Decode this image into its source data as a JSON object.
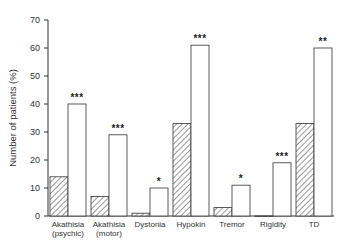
{
  "chart_data": {
    "type": "bar",
    "title": "",
    "xlabel": "",
    "ylabel": "Number of patients (%)",
    "ylim": [
      0,
      70
    ],
    "yticks": [
      0,
      10,
      20,
      30,
      40,
      50,
      60,
      70
    ],
    "grid": false,
    "legend": null,
    "categories": [
      [
        "Akathisia",
        "(psychic)"
      ],
      [
        "Akathisia",
        "(motor)"
      ],
      [
        "Dystonia"
      ],
      [
        "Hypokin"
      ],
      [
        "Tremor"
      ],
      [
        "Rigidity"
      ],
      [
        "TD"
      ]
    ],
    "series": [
      {
        "name": "hatched",
        "pattern": "diagonal-hatch",
        "values": [
          14,
          7,
          1,
          33,
          3,
          0,
          33
        ]
      },
      {
        "name": "open",
        "pattern": "white",
        "values": [
          40,
          29,
          10,
          61,
          11,
          19,
          60
        ]
      }
    ],
    "annotations": [
      "***",
      "***",
      "*",
      "***",
      "*",
      "***",
      "**"
    ]
  }
}
